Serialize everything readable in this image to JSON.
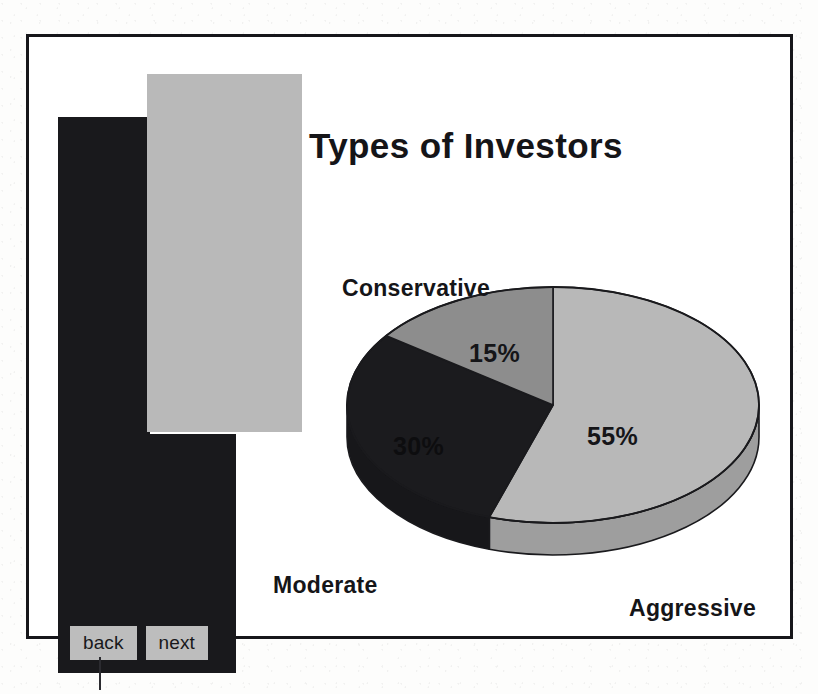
{
  "slide": {
    "title": "Types of Investors"
  },
  "nav": {
    "back_label": "back",
    "next_label": "next"
  },
  "colors": {
    "frame": "#16161a",
    "black_panel": "#19191c",
    "gray_panel": "#b9b9b9",
    "button_face": "#bdbdbd",
    "slice_aggressive": "#b8b8b8",
    "slice_moderate": "#1b1b1e",
    "slice_conservative": "#8d8d8d",
    "slice_outline": "#1a1a1d",
    "text": "#151518"
  },
  "chart_data": {
    "type": "pie",
    "title": "Types of Investors",
    "xlabel": "",
    "ylabel": "",
    "grid": false,
    "legend_position": "around-slices",
    "three_d": true,
    "start_angle_deg": 0,
    "direction": "clockwise",
    "categories": [
      "Aggressive",
      "Moderate",
      "Conservative"
    ],
    "values": [
      55,
      30,
      15
    ],
    "value_labels": [
      "55%",
      "30%",
      "15%"
    ],
    "unit": "%",
    "slices": [
      {
        "name": "Aggressive",
        "value": 55,
        "label": "55%",
        "color": "#b8b8b8",
        "category_label": "Aggressive"
      },
      {
        "name": "Moderate",
        "value": 30,
        "label": "30%",
        "color": "#1b1b1e",
        "category_label": "Moderate"
      },
      {
        "name": "Conservative",
        "value": 15,
        "label": "15%",
        "color": "#8d8d8d",
        "category_label": "Conservative"
      }
    ]
  }
}
